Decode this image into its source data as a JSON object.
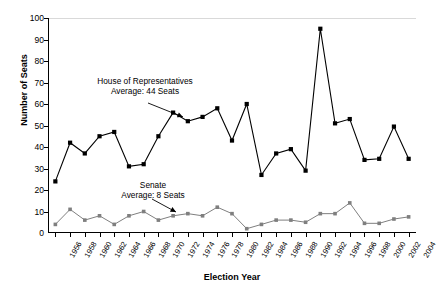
{
  "chart_data": {
    "type": "line",
    "title": "",
    "xlabel": "Election Year",
    "ylabel": "Number of Seats",
    "ylim": [
      0,
      100
    ],
    "ytick_step": 10,
    "yticks": [
      0,
      10,
      20,
      30,
      40,
      50,
      60,
      70,
      80,
      90,
      100
    ],
    "grid": false,
    "legend_position": "none",
    "categories": [
      "1956",
      "1958",
      "1960",
      "1962",
      "1964",
      "1966",
      "1968",
      "1970",
      "1972",
      "1974",
      "1976",
      "1978",
      "1980",
      "1982",
      "1984",
      "1986",
      "1988",
      "1990",
      "1992",
      "1994",
      "1996",
      "1998",
      "2000",
      "2002",
      "2004"
    ],
    "series": [
      {
        "name": "House of Representatives",
        "marker": "filled-square",
        "color": "#000000",
        "values": [
          24,
          42,
          37,
          45,
          47,
          31,
          32,
          45,
          56,
          52,
          54,
          58,
          43,
          60,
          27,
          37,
          39,
          29,
          95,
          51,
          53,
          34,
          34.5,
          49.5,
          34.5
        ]
      },
      {
        "name": "Senate",
        "marker": "filled-square",
        "color": "#7f7f7f",
        "values": [
          4,
          11,
          6,
          8,
          4,
          8,
          10,
          6,
          8,
          9,
          8,
          12,
          9,
          2,
          4,
          6,
          6,
          5,
          9,
          9,
          14,
          4.5,
          4.5,
          6.5,
          7.5
        ]
      }
    ],
    "annotations": [
      {
        "id": "house",
        "line1": "House of Representatives",
        "line2": "Average: 44 Seats",
        "points_to_index": 8
      },
      {
        "id": "senate",
        "line1": "Senate",
        "line2": "Average: 8 Seats",
        "points_to_index": 8
      }
    ]
  }
}
